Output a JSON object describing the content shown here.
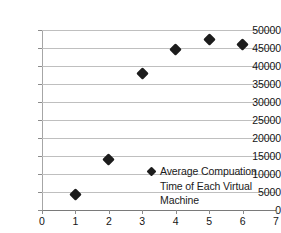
{
  "chart_data": {
    "type": "scatter",
    "title": "",
    "subtitle": "",
    "xlabel": "",
    "ylabel": "",
    "xlim": [
      0,
      7
    ],
    "ylim": [
      0,
      50000
    ],
    "grid": "horizontal",
    "legend_position": "inside-plot-right",
    "series": [
      {
        "name": "Average Compuation Time of Each Virtual Machine",
        "marker": "diamond",
        "color": "#1c1c1c",
        "x": [
          1,
          2,
          3,
          4,
          5,
          6
        ],
        "values": [
          4200,
          14000,
          38000,
          44500,
          47500,
          46000
        ]
      }
    ],
    "x_ticks": [
      0,
      1,
      2,
      3,
      4,
      5,
      6,
      7
    ],
    "x_tick_labels": [
      "0",
      "1",
      "2",
      "3",
      "4",
      "5",
      "6",
      "7"
    ],
    "y_ticks": [
      0,
      5000,
      10000,
      15000,
      20000,
      25000,
      30000,
      35000,
      40000,
      45000,
      50000
    ],
    "y_tick_labels": [
      "0",
      "5000",
      "10000",
      "15000",
      "20000",
      "25000",
      "30000",
      "35000",
      "40000",
      "45000",
      "50000"
    ]
  },
  "legend": {
    "entries": [
      {
        "label": "Average Compuation Time of Each Virtual Machine",
        "marker_name": "diamond-marker"
      }
    ]
  },
  "colors": {
    "marker": "#1c1c1c",
    "gridline": "#bfbfbf",
    "axis": "#7a7a7a",
    "background": "#ffffff",
    "text": "#1a1a1a"
  }
}
